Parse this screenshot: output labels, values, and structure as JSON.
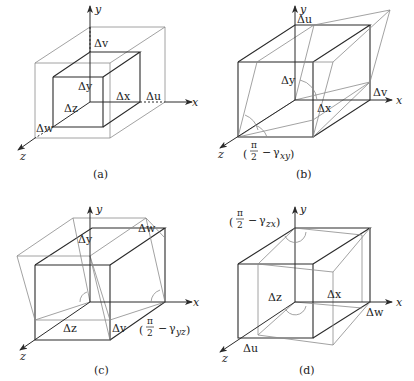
{
  "figure": {
    "panels": [
      {
        "id": "a",
        "caption": "(a)",
        "axes": {
          "x": "x",
          "y": "y",
          "z": "z"
        },
        "labels": {
          "dy": "Δy",
          "dx": "Δx",
          "dz": "Δz",
          "du": "Δu",
          "dv": "Δv",
          "dw": "Δw"
        }
      },
      {
        "id": "b",
        "caption": "(b)",
        "axes": {
          "x": "x",
          "y": "y",
          "z": "z"
        },
        "labels": {
          "du": "Δu",
          "dy": "Δy",
          "dx": "Δx",
          "dv": "Δv",
          "angle": "(π/2 − γxy)",
          "angle_sub": "xy"
        }
      },
      {
        "id": "c",
        "caption": "(c)",
        "axes": {
          "x": "x",
          "y": "y",
          "z": "z"
        },
        "labels": {
          "dw": "Δw",
          "dy": "Δy",
          "dz": "Δz",
          "dv": "Δv",
          "angle": "(π/2 − γyz)",
          "angle_sub": "yz"
        }
      },
      {
        "id": "d",
        "caption": "(d)",
        "axes": {
          "x": "x",
          "y": "y",
          "z": "z"
        },
        "labels": {
          "dx": "Δx",
          "dz": "Δz",
          "dw": "Δw",
          "du": "Δu",
          "angle": "(π/2 − γzx)",
          "angle_sub": "zx"
        }
      }
    ],
    "symbols": {
      "pi": "π",
      "two": "2",
      "minus": "−",
      "gamma": "γ",
      "lparen": "(",
      "rparen": ")"
    }
  }
}
